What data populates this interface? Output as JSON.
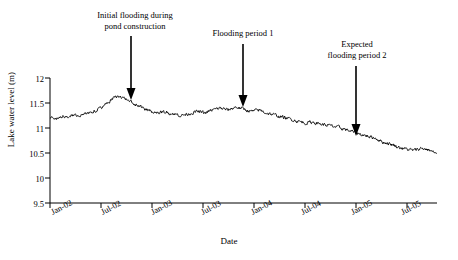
{
  "chart_data": {
    "type": "line",
    "title": "",
    "xlabel": "Date",
    "ylabel": "Lake water level (m)",
    "ylim": [
      9.5,
      12
    ],
    "yticks": [
      "9.5",
      "10",
      "10.5",
      "11",
      "11.5",
      "12"
    ],
    "xticks": [
      "Jan-02",
      "Jul-02",
      "Jan-03",
      "Jul-03",
      "Jan-04",
      "Jul-04",
      "Jan-05",
      "Jul-05"
    ],
    "xlim": [
      "Jan-02",
      "Oct-05"
    ],
    "grid": false,
    "legend": null,
    "series": [
      {
        "name": "Lake water level",
        "color": "#000000",
        "x": [
          0,
          0.02,
          0.04,
          0.06,
          0.08,
          0.1,
          0.12,
          0.14,
          0.16,
          0.18,
          0.2,
          0.22,
          0.24,
          0.26,
          0.28,
          0.3,
          0.32,
          0.34,
          0.36,
          0.38,
          0.4,
          0.42,
          0.44,
          0.46,
          0.48,
          0.5,
          0.52,
          0.54,
          0.56,
          0.58,
          0.6,
          0.62,
          0.64,
          0.66,
          0.68,
          0.7,
          0.72,
          0.74,
          0.76,
          0.78,
          0.8,
          0.82,
          0.84,
          0.86,
          0.88,
          0.9,
          0.92,
          0.94,
          0.96,
          0.98,
          1.0
        ],
        "values": [
          11.22,
          11.2,
          11.23,
          11.26,
          11.24,
          11.3,
          11.36,
          11.45,
          11.58,
          11.63,
          11.55,
          11.48,
          11.4,
          11.34,
          11.3,
          11.32,
          11.28,
          11.25,
          11.29,
          11.33,
          11.3,
          11.36,
          11.4,
          11.36,
          11.42,
          11.38,
          11.33,
          11.36,
          11.3,
          11.26,
          11.22,
          11.18,
          11.14,
          11.1,
          11.12,
          11.08,
          11.05,
          11.02,
          10.98,
          10.93,
          10.88,
          10.84,
          10.8,
          10.72,
          10.68,
          10.62,
          10.58,
          10.55,
          10.6,
          10.56,
          10.48
        ]
      }
    ],
    "annotations": [
      {
        "id": "annotation-1",
        "text": "Initial flooding during\npond construction",
        "target_x": "Jul-02",
        "target_y": 11.55
      },
      {
        "id": "annotation-2",
        "text": "Flooding period 1",
        "target_x": "Jul-03",
        "target_y": 11.35
      },
      {
        "id": "annotation-3",
        "text": "Expected\nflooding period 2",
        "target_x": "Jan-05",
        "target_y": 10.72
      }
    ]
  }
}
